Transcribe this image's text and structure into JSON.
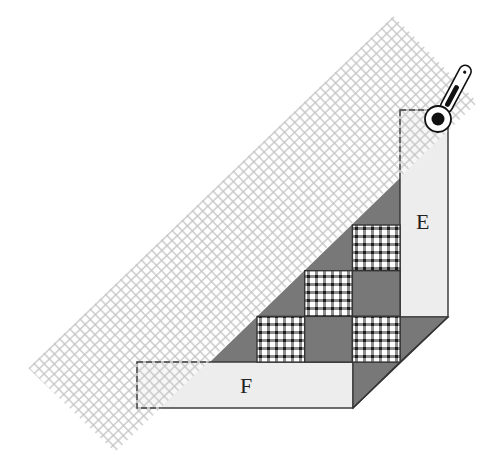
{
  "diagram": {
    "labels": {
      "strip_e": "E",
      "strip_f": "F"
    },
    "checker_grid": {
      "rows": 3,
      "cols": 3,
      "cells": [
        [
          "empty",
          "empty",
          "gingham"
        ],
        [
          "empty",
          "gingham",
          "dark"
        ],
        [
          "gingham",
          "dark",
          "gingham"
        ]
      ]
    },
    "colors": {
      "background": "#ffffff",
      "strip_fill": "#ededed",
      "dark_fabric": "#787878",
      "gingham_dark": "#2e2e2e",
      "gingham_light": "#ffffff",
      "ruler_grid": "#c4c4c4",
      "outline": "#333333",
      "cutter_blade": "#111111"
    },
    "ruler": {
      "grid_cells_across": 17,
      "grid_cells_along": 72
    },
    "tools": [
      {
        "name": "rotary cutter",
        "icon": "rotary-cutter-icon"
      },
      {
        "name": "quilting ruler",
        "icon": "grid-ruler-icon"
      }
    ]
  }
}
